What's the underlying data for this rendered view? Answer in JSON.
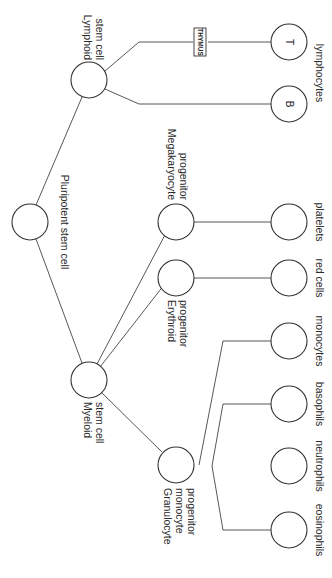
{
  "diagram": {
    "type": "hematopoiesis-lineage-tree",
    "orientation": "rotated-90-clockwise",
    "nodes": {
      "pluripotent": {
        "label": "Pluripotent stem cell"
      },
      "lymphoid": {
        "label_line1": "Lymphoid",
        "label_line2": "stem cell"
      },
      "myeloid": {
        "label_line1": "Myeloid",
        "label_line2": "stem cell"
      },
      "megakaryocyte": {
        "label_line1": "Megakaryocyte",
        "label_line2": "progenitor"
      },
      "erythroid": {
        "label_line1": "Erythroid",
        "label_line2": "progenitor"
      },
      "granulocyte": {
        "label_line1": "Granulocyte",
        "label_line2": "monocyte",
        "label_line3": "progenitor"
      },
      "thymus": {
        "label": "THYMUS"
      },
      "t_cell": {
        "inner": "T"
      },
      "b_cell": {
        "inner": "B"
      },
      "lymphocytes": {
        "label": "lymphocytes"
      },
      "platelets": {
        "label": "platelets"
      },
      "red_cells": {
        "label": "red cells"
      },
      "monocytes": {
        "label": "monocytes"
      },
      "basophils": {
        "label": "basophils"
      },
      "neutrophils": {
        "label": "neutrophils"
      },
      "eosinophils": {
        "label": "eosinophils"
      }
    },
    "edges": [
      [
        "pluripotent",
        "lymphoid"
      ],
      [
        "pluripotent",
        "myeloid"
      ],
      [
        "lymphoid",
        "thymus"
      ],
      [
        "thymus",
        "t_cell"
      ],
      [
        "lymphoid",
        "b_cell"
      ],
      [
        "myeloid",
        "megakaryocyte"
      ],
      [
        "myeloid",
        "erythroid"
      ],
      [
        "myeloid",
        "granulocyte"
      ],
      [
        "megakaryocyte",
        "platelets"
      ],
      [
        "erythroid",
        "red_cells"
      ],
      [
        "granulocyte",
        "monocytes"
      ],
      [
        "granulocyte",
        "basophils"
      ],
      [
        "granulocyte",
        "neutrophils"
      ],
      [
        "granulocyte",
        "eosinophils"
      ]
    ]
  }
}
